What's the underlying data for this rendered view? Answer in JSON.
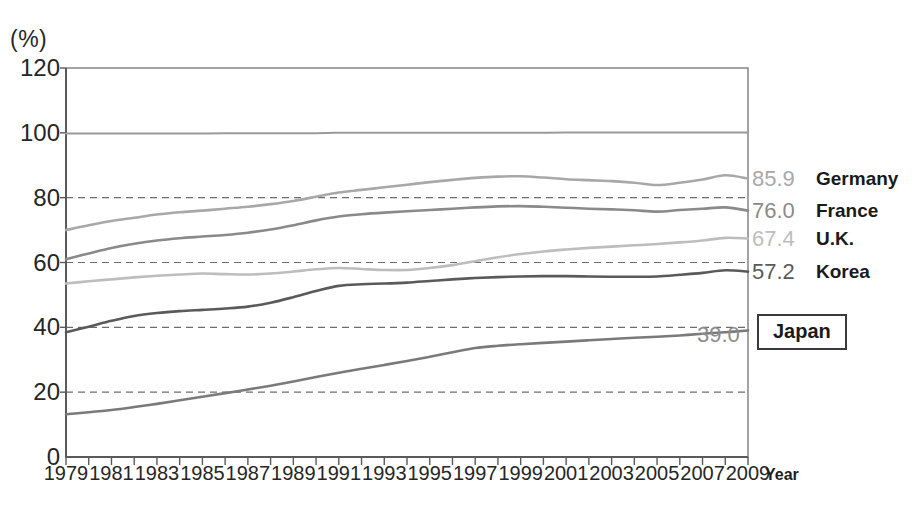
{
  "chart_data": {
    "type": "line",
    "title": "",
    "xlabel": "Year",
    "ylabel": "(%)",
    "ylim": [
      0,
      120
    ],
    "xlim": [
      1979,
      2009
    ],
    "ytick_step": 20,
    "yticks": [
      "120",
      "100",
      "80",
      "60",
      "40",
      "20",
      "0"
    ],
    "grid": "dashed horizontal gridlines at 20, 40, 60, 80",
    "legend_position": "right",
    "x": [
      1979,
      1980,
      1981,
      1982,
      1983,
      1984,
      1985,
      1986,
      1987,
      1988,
      1989,
      1990,
      1991,
      1992,
      1993,
      1994,
      1995,
      1996,
      1997,
      1998,
      1999,
      2000,
      2001,
      2002,
      2003,
      2004,
      2005,
      2006,
      2007,
      2008,
      2009
    ],
    "xtick_labels": [
      "1979",
      "1981",
      "1983",
      "1985",
      "1987",
      "1989",
      "1991",
      "1993",
      "1995",
      "1997",
      "1999",
      "2001",
      "2003",
      "2005",
      "2007",
      "2009"
    ],
    "series": [
      {
        "name": "Germany",
        "end_value": "85.9",
        "color": "#a8a8a8",
        "values": [
          70.0,
          71.5,
          72.8,
          73.8,
          74.8,
          75.5,
          76.0,
          76.6,
          77.2,
          78.0,
          79.0,
          80.3,
          81.6,
          82.4,
          83.2,
          84.0,
          84.8,
          85.5,
          86.1,
          86.5,
          86.6,
          86.2,
          85.7,
          85.4,
          85.1,
          84.6,
          83.9,
          84.6,
          85.6,
          86.9,
          85.9
        ]
      },
      {
        "name": "France",
        "end_value": "76.0",
        "color": "#8a8a8a",
        "values": [
          61.0,
          62.8,
          64.5,
          65.8,
          66.8,
          67.5,
          68.0,
          68.5,
          69.2,
          70.2,
          71.5,
          73.0,
          74.2,
          74.9,
          75.4,
          75.8,
          76.2,
          76.6,
          77.0,
          77.3,
          77.4,
          77.2,
          76.9,
          76.6,
          76.4,
          76.1,
          75.7,
          76.2,
          76.6,
          77.0,
          76.0
        ]
      },
      {
        "name": "U.K.",
        "end_value": "67.4",
        "color": "#bdbdbd",
        "values": [
          53.5,
          54.2,
          54.8,
          55.4,
          55.9,
          56.3,
          56.6,
          56.4,
          56.3,
          56.6,
          57.2,
          57.9,
          58.3,
          58.0,
          57.7,
          57.7,
          58.3,
          59.2,
          60.4,
          61.6,
          62.6,
          63.4,
          64.0,
          64.5,
          64.9,
          65.3,
          65.7,
          66.2,
          66.8,
          67.6,
          67.4
        ]
      },
      {
        "name": "Korea",
        "end_value": "57.2",
        "color": "#5a5a5a",
        "values": [
          38.5,
          40.2,
          42.0,
          43.5,
          44.4,
          45.0,
          45.4,
          45.8,
          46.4,
          47.6,
          49.3,
          51.2,
          52.8,
          53.3,
          53.5,
          53.8,
          54.3,
          54.8,
          55.2,
          55.5,
          55.7,
          55.8,
          55.8,
          55.7,
          55.6,
          55.6,
          55.7,
          56.2,
          56.8,
          57.6,
          57.2
        ]
      },
      {
        "name": "Japan",
        "end_value": "39.0",
        "color": "#7a7a7a",
        "boxed": true,
        "values": [
          13.2,
          13.8,
          14.5,
          15.4,
          16.4,
          17.5,
          18.6,
          19.7,
          20.8,
          22.0,
          23.3,
          24.7,
          26.0,
          27.2,
          28.4,
          29.6,
          30.9,
          32.3,
          33.6,
          34.3,
          34.8,
          35.2,
          35.6,
          36.0,
          36.4,
          36.8,
          37.1,
          37.5,
          38.0,
          38.5,
          39.0
        ]
      },
      {
        "name": "reference-100",
        "end_value": "",
        "color": "#9a9a9a",
        "values": [
          99.8,
          99.8,
          99.8,
          99.8,
          99.8,
          99.8,
          99.8,
          99.9,
          99.9,
          99.9,
          99.9,
          99.9,
          100.0,
          100.0,
          100.0,
          100.0,
          100.0,
          100.0,
          100.0,
          100.0,
          100.0,
          100.0,
          100.1,
          100.1,
          100.1,
          100.1,
          100.1,
          100.1,
          100.1,
          100.1,
          100.1
        ]
      }
    ]
  },
  "axis": {
    "unit_label": "(%)",
    "x_title": "Year"
  },
  "legend": {
    "rows": [
      {
        "value": "85.9",
        "name": "Germany"
      },
      {
        "value": "76.0",
        "name": "France"
      },
      {
        "value": "67.4",
        "name": "U.K."
      },
      {
        "value": "57.2",
        "name": "Korea"
      }
    ],
    "japan": {
      "value": "39.0",
      "name": "Japan"
    }
  }
}
